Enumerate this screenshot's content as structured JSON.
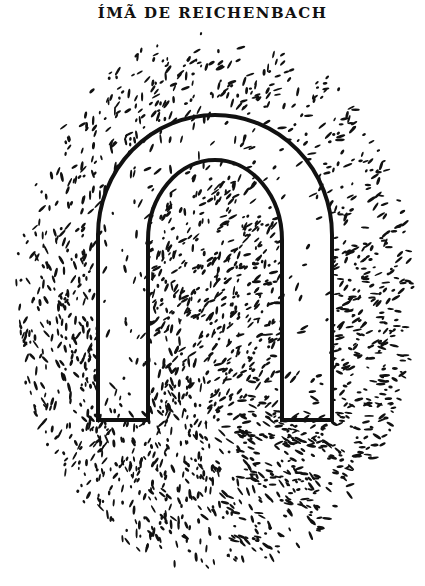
{
  "figure": {
    "title": "ÍMÃ DE REICHENBACH",
    "ink_color": "#111111",
    "paper_color": "#ffffff"
  }
}
